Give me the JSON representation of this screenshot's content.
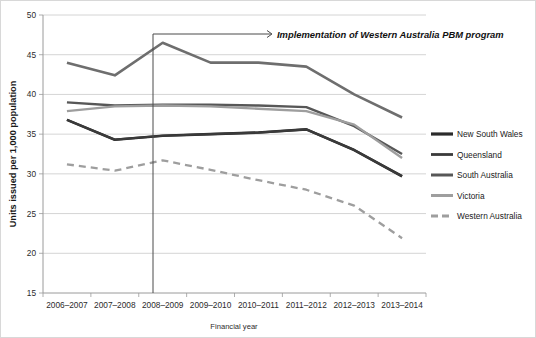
{
  "chart_data": {
    "type": "line",
    "title": "",
    "xlabel": "Financial year",
    "ylabel": "Units issued per 1,000 population",
    "categories": [
      "2006–2007",
      "2007–2008",
      "2008–2009",
      "2009–2010",
      "2010–2011",
      "2011–2012",
      "2012–2013",
      "2013–2014"
    ],
    "ylim": [
      15,
      50
    ],
    "yticks": [
      15,
      20,
      25,
      30,
      35,
      40,
      45,
      50
    ],
    "ytick_labels": [
      "15",
      "20",
      "25",
      "30",
      "35",
      "40",
      "45",
      "50"
    ],
    "grid": "horizontal",
    "legend_position": "right",
    "series": [
      {
        "name": "New South Wales",
        "color": "#2b2b2b",
        "style": "solid",
        "width": 2.6,
        "values": [
          36.8,
          34.3,
          34.8,
          35.0,
          35.2,
          35.6,
          33.0,
          29.7
        ]
      },
      {
        "name": "Queensland",
        "color": "#3a3a3a",
        "style": "solid",
        "width": 2.2,
        "values": [
          36.8,
          34.3,
          34.8,
          35.0,
          35.2,
          35.6,
          33.0,
          29.7
        ]
      },
      {
        "name": "South Australia",
        "color": "#575757",
        "style": "solid",
        "width": 2.4,
        "values": [
          39.0,
          38.6,
          38.7,
          38.7,
          38.6,
          38.4,
          36.0,
          32.5
        ]
      },
      {
        "name": "Victoria",
        "color": "#9e9e9e",
        "style": "solid",
        "width": 2.4,
        "values": [
          37.9,
          38.5,
          38.6,
          38.5,
          38.2,
          37.9,
          36.2,
          32.0
        ]
      },
      {
        "name": "Western Australia",
        "color": "#9e9e9e",
        "style": "dashed",
        "width": 2.3,
        "values": [
          31.2,
          30.4,
          31.7,
          30.5,
          29.2,
          28.0,
          26.0,
          21.9
        ]
      }
    ],
    "extra_series_note": {
      "victoria_upper_band": {
        "name": "Victoria (upper trace 2006–2014)",
        "color": "#6e6e6e",
        "values": [
          44.0,
          42.4,
          46.5,
          44.0,
          44.0,
          43.5,
          40.0,
          37.1
        ]
      }
    },
    "annotations": [
      {
        "name": "pbm-implementation",
        "text": "Implementation of Western Australia PBM program",
        "at_category": "2008–2009",
        "style": "arrow-with-vertical-marker"
      }
    ]
  },
  "legend": {
    "items": [
      {
        "label": "New South Wales"
      },
      {
        "label": "Queensland"
      },
      {
        "label": "South Australia"
      },
      {
        "label": "Victoria"
      },
      {
        "label": "Western Australia"
      }
    ]
  }
}
